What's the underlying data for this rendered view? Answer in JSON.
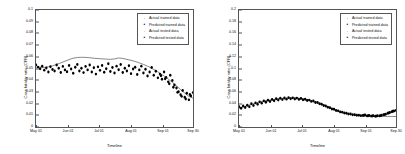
{
  "figure": {
    "panel_count": 2,
    "background": "#ffffff",
    "foreground": "#000000"
  },
  "legend_entries": [
    {
      "label": "Actual trained data",
      "marker": "dot-small",
      "symbol": "·"
    },
    {
      "label": "Predicted trained data",
      "marker": "dot-filled",
      "symbol": "•"
    },
    {
      "label": "Actual tested data",
      "marker": "dot-small",
      "symbol": "·"
    },
    {
      "label": "Predicted tested data",
      "marker": "dot-filled",
      "symbol": "•"
    }
  ],
  "chart_data": [
    {
      "panel": "left",
      "type": "scatter",
      "title": "",
      "xlabel": "Timeline",
      "ylabel": "Case fatality ratio (CFR)",
      "grid": false,
      "legend_position": "top-right",
      "xlim": [
        0,
        152
      ],
      "ylim": [
        0,
        0.1
      ],
      "yticks": [
        0,
        0.01,
        0.02,
        0.03,
        0.04,
        0.05,
        0.06,
        0.07,
        0.08,
        0.09,
        0.1
      ],
      "yticklabels": [
        "0",
        "0.01",
        "0.02",
        "0.03",
        "0.04",
        "0.05",
        "0.06",
        "0.07",
        "0.08",
        "0.09",
        "0.1"
      ],
      "xticks": [
        0,
        31,
        61,
        92,
        123,
        152
      ],
      "xticklabels": [
        "May 01",
        "Jun 01",
        "Jul 01",
        "Aug 01",
        "Sep 01",
        "Sep 30"
      ],
      "series": [
        {
          "name": "Actual trained data",
          "style": "line",
          "color": "#555555",
          "x": [
            0,
            4,
            8,
            12,
            16,
            20,
            24,
            28,
            32,
            36,
            40,
            44,
            48,
            52,
            56,
            60,
            64,
            68,
            72,
            76,
            80,
            84,
            88,
            92,
            96,
            100,
            104,
            108,
            112,
            116,
            120,
            124,
            128,
            132,
            136,
            140,
            144,
            148,
            152
          ],
          "y": [
            0.0505,
            0.0512,
            0.0508,
            0.0515,
            0.0522,
            0.0535,
            0.0548,
            0.0562,
            0.0576,
            0.0588,
            0.0594,
            0.0596,
            0.0595,
            0.0592,
            0.0588,
            0.0585,
            0.0582,
            0.058,
            0.0578,
            0.0582,
            0.059,
            0.0586,
            0.0578,
            0.057,
            0.056,
            0.0548,
            0.0535,
            0.052,
            0.0502,
            0.0482,
            0.046,
            0.0436,
            0.041,
            0.0382,
            0.0352,
            0.032,
            0.029,
            0.0262,
            0.0246
          ]
        },
        {
          "name": "Predicted trained data",
          "style": "scatter",
          "color": "#000000",
          "x": [
            0,
            2,
            4,
            6,
            8,
            10,
            12,
            14,
            16,
            18,
            20,
            22,
            24,
            26,
            28,
            30,
            32,
            34,
            36,
            38,
            40,
            42,
            44,
            46,
            48,
            50,
            52,
            54,
            56,
            58,
            60,
            62,
            64,
            66,
            68,
            70,
            72,
            74,
            76,
            78,
            80,
            82,
            84,
            86,
            88,
            90,
            92,
            94,
            96,
            98,
            100,
            102,
            104,
            106,
            108,
            110,
            112,
            114,
            116,
            118
          ],
          "y": [
            0.053,
            0.0512,
            0.0498,
            0.052,
            0.0486,
            0.0505,
            0.047,
            0.0515,
            0.0492,
            0.0478,
            0.053,
            0.0502,
            0.0466,
            0.0518,
            0.0488,
            0.0472,
            0.0525,
            0.0496,
            0.046,
            0.051,
            0.0534,
            0.0478,
            0.0502,
            0.0465,
            0.0518,
            0.0488,
            0.053,
            0.047,
            0.0506,
            0.0452,
            0.0514,
            0.0484,
            0.0526,
            0.0468,
            0.0498,
            0.054,
            0.0474,
            0.0508,
            0.0462,
            0.052,
            0.049,
            0.0534,
            0.0466,
            0.0502,
            0.0478,
            0.0524,
            0.0456,
            0.0496,
            0.051,
            0.0448,
            0.0488,
            0.052,
            0.0462,
            0.0494,
            0.0436,
            0.047,
            0.0508,
            0.0442,
            0.0476,
            0.042
          ]
        },
        {
          "name": "Actual tested data",
          "style": "scatter",
          "color": "#000000",
          "x": [
            120,
            122,
            124,
            126,
            128,
            130,
            132,
            134,
            136,
            138,
            140,
            142,
            144,
            146,
            148,
            150,
            152
          ],
          "y": [
            0.0452,
            0.0408,
            0.047,
            0.0424,
            0.0386,
            0.0442,
            0.0398,
            0.036,
            0.0334,
            0.0302,
            0.0276,
            0.0312,
            0.0254,
            0.0288,
            0.0232,
            0.0266,
            0.0294
          ]
        },
        {
          "name": "Predicted tested data",
          "style": "scatter",
          "color": "#000000",
          "x": [
            121,
            125,
            129,
            133,
            137,
            141,
            145,
            149
          ],
          "y": [
            0.0438,
            0.0412,
            0.037,
            0.034,
            0.0296,
            0.0262,
            0.024,
            0.0278
          ]
        }
      ]
    },
    {
      "panel": "right",
      "type": "scatter",
      "title": "",
      "xlabel": "Timeline",
      "ylabel": "Case fatality ratio (CFR)",
      "grid": false,
      "legend_position": "top-right",
      "xlim": [
        0,
        152
      ],
      "ylim": [
        0,
        0.2
      ],
      "yticks": [
        0,
        0.02,
        0.04,
        0.06,
        0.08,
        0.1,
        0.12,
        0.14,
        0.16,
        0.18,
        0.2
      ],
      "yticklabels": [
        "0",
        "0.02",
        "0.04",
        "0.06",
        "0.08",
        "0.1",
        "0.12",
        "0.14",
        "0.16",
        "0.18",
        "0.2"
      ],
      "xticks": [
        0,
        31,
        61,
        92,
        123,
        152
      ],
      "xticklabels": [
        "May 01",
        "Jun 01",
        "Jul 01",
        "Aug 01",
        "Sep 01",
        "Sep 30"
      ],
      "series": [
        {
          "name": "Actual trained data",
          "style": "line",
          "color": "#555555",
          "x": [
            0,
            4,
            8,
            12,
            16,
            20,
            24,
            28,
            32,
            36,
            40,
            44,
            48,
            52,
            56,
            60,
            64,
            68,
            72,
            76,
            80,
            84,
            88,
            92,
            96,
            100,
            104,
            108,
            112,
            116,
            120,
            124,
            128,
            132,
            136,
            140,
            144,
            148,
            152
          ],
          "y": [
            0.032,
            0.0342,
            0.0365,
            0.0388,
            0.0408,
            0.0428,
            0.0444,
            0.0456,
            0.0468,
            0.0478,
            0.0486,
            0.0492,
            0.0496,
            0.0498,
            0.0496,
            0.049,
            0.0478,
            0.0462,
            0.044,
            0.0414,
            0.0386,
            0.0356,
            0.0326,
            0.0298,
            0.0272,
            0.025,
            0.0232,
            0.0218,
            0.0206,
            0.0198,
            0.0192,
            0.0188,
            0.0185,
            0.0183,
            0.0182,
            0.0181,
            0.018,
            0.018,
            0.018
          ]
        },
        {
          "name": "Predicted trained data",
          "style": "scatter",
          "color": "#000000",
          "x": [
            0,
            2,
            4,
            6,
            8,
            10,
            12,
            14,
            16,
            18,
            20,
            22,
            24,
            26,
            28,
            30,
            32,
            34,
            36,
            38,
            40,
            42,
            44,
            46,
            48,
            50,
            52,
            54,
            56,
            58,
            60,
            62,
            64,
            66,
            68,
            70,
            72,
            74,
            76,
            78,
            80,
            82,
            84,
            86,
            88,
            90,
            92,
            94,
            96,
            98,
            100,
            102,
            104,
            106,
            108,
            110,
            112,
            114,
            116,
            118
          ],
          "y": [
            0.0348,
            0.0322,
            0.036,
            0.0334,
            0.0372,
            0.0346,
            0.0396,
            0.0368,
            0.0412,
            0.039,
            0.043,
            0.0408,
            0.0446,
            0.0424,
            0.0458,
            0.0436,
            0.047,
            0.0448,
            0.0482,
            0.0462,
            0.049,
            0.0468,
            0.0496,
            0.0476,
            0.0502,
            0.0482,
            0.0498,
            0.0478,
            0.0494,
            0.0472,
            0.0486,
            0.0464,
            0.0474,
            0.0452,
            0.046,
            0.0438,
            0.0444,
            0.042,
            0.0418,
            0.0396,
            0.039,
            0.0368,
            0.036,
            0.0338,
            0.033,
            0.0308,
            0.0302,
            0.0282,
            0.0276,
            0.0258,
            0.0254,
            0.0238,
            0.0236,
            0.0222,
            0.0222,
            0.021,
            0.021,
            0.02,
            0.0202,
            0.0194
          ]
        },
        {
          "name": "Actual tested data",
          "style": "scatter",
          "color": "#000000",
          "x": [
            120,
            122,
            124,
            126,
            128,
            130,
            132,
            134,
            136,
            138,
            140,
            142,
            144,
            146,
            148,
            150,
            152
          ],
          "y": [
            0.0196,
            0.0204,
            0.019,
            0.0198,
            0.0186,
            0.0194,
            0.0184,
            0.0192,
            0.019,
            0.02,
            0.0208,
            0.022,
            0.0234,
            0.0248,
            0.0262,
            0.0274,
            0.0284
          ]
        },
        {
          "name": "Predicted tested data",
          "style": "scatter",
          "color": "#000000",
          "x": [
            121,
            125,
            129,
            133,
            137,
            141,
            145,
            149
          ],
          "y": [
            0.02,
            0.0192,
            0.0188,
            0.0186,
            0.0194,
            0.0212,
            0.024,
            0.0268
          ]
        }
      ]
    }
  ]
}
